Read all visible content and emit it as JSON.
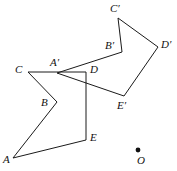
{
  "figure": {
    "background_color": "#ffffff",
    "stroke_color": "#1a1a1a",
    "stroke_width": 1,
    "width": 177,
    "height": 171
  },
  "labels": {
    "A": "A",
    "B": "B",
    "C": "C",
    "D": "D",
    "E": "E",
    "A_prime": "A′",
    "B_prime": "B′",
    "C_prime": "C′",
    "D_prime": "D′",
    "E_prime": "E′",
    "O": "O"
  },
  "chart_data": {
    "type": "scatter",
    "xlabel": "",
    "ylabel": "",
    "xlim": [
      0,
      177
    ],
    "ylim": [
      0,
      171
    ],
    "grid": false,
    "legend": "none",
    "note": "Two congruent arrow-shaped pentagons; primed figure is the image of the unprimed figure under a rotation about center O. Coordinates are in pixel space with y increasing downward.",
    "shapes": [
      {
        "name": "pentagon-ABCDE",
        "closed": true,
        "vertices": [
          {
            "label": "A",
            "x": 13,
            "y": 158
          },
          {
            "label": "B",
            "x": 57,
            "y": 102
          },
          {
            "label": "C",
            "x": 28,
            "y": 72
          },
          {
            "label": "D",
            "x": 86,
            "y": 72
          },
          {
            "label": "E",
            "x": 86,
            "y": 140
          }
        ],
        "path_order": [
          "A",
          "B",
          "C",
          "D",
          "E",
          "A"
        ]
      },
      {
        "name": "pentagon-A-prime-B-prime-C-prime-D-prime-E-prime",
        "closed": true,
        "vertices": [
          {
            "label": "A′",
            "x": 57,
            "y": 73
          },
          {
            "label": "B′",
            "x": 122,
            "y": 52
          },
          {
            "label": "C′",
            "x": 118,
            "y": 18
          },
          {
            "label": "D′",
            "x": 158,
            "y": 47
          },
          {
            "label": "E′",
            "x": 124,
            "y": 96
          }
        ],
        "path_order": [
          "A′",
          "B′",
          "C′",
          "D′",
          "E′",
          "A′"
        ]
      }
    ],
    "points": [
      {
        "label": "O",
        "x": 138,
        "y": 150,
        "style": "filled-dot",
        "radius": 2.4
      }
    ],
    "label_positions": [
      {
        "label": "A",
        "x": 3,
        "y": 154
      },
      {
        "label": "B",
        "x": 41,
        "y": 97
      },
      {
        "label": "C",
        "x": 15,
        "y": 64
      },
      {
        "label": "D",
        "x": 90,
        "y": 64
      },
      {
        "label": "E",
        "x": 90,
        "y": 132
      },
      {
        "label": "A′",
        "x": 50,
        "y": 57
      },
      {
        "label": "B′",
        "x": 105,
        "y": 40
      },
      {
        "label": "C′",
        "x": 110,
        "y": 3
      },
      {
        "label": "D′",
        "x": 161,
        "y": 39
      },
      {
        "label": "E′",
        "x": 117,
        "y": 100
      },
      {
        "label": "O",
        "x": 137,
        "y": 155
      }
    ]
  }
}
